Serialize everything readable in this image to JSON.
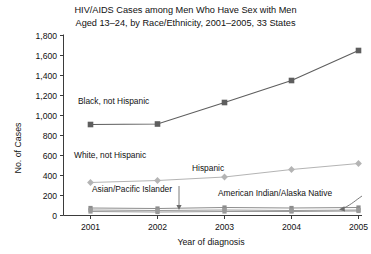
{
  "chart_data": {
    "type": "line",
    "title": "HIV/AIDS Cases among Men Who Have Sex with Men Aged 13–24, by Race/Ethnicity, 2001–2005, 33 States",
    "title_line1": "HIV/AIDS Cases among Men Who Have Sex with Men",
    "title_line2": "Aged 13–24, by Race/Ethnicity, 2001–2005, 33 States",
    "xlabel": "Year of diagnosis",
    "ylabel": "No. of Cases",
    "categories": [
      "2001",
      "2002",
      "2003",
      "2004",
      "2005"
    ],
    "x": [
      2001,
      2002,
      2003,
      2004,
      2005
    ],
    "ylim": [
      0,
      1800
    ],
    "yticks": [
      "0",
      "200",
      "400",
      "600",
      "800",
      "1,000",
      "1,200",
      "1,400",
      "1,600",
      "1,800"
    ],
    "ytick_values": [
      0,
      200,
      400,
      600,
      800,
      1000,
      1200,
      1400,
      1600,
      1800
    ],
    "grid": false,
    "legend": "inline-labels",
    "series": [
      {
        "name": "Black, not Hispanic",
        "marker": "square",
        "color": "#5e5e5e",
        "values": [
          910,
          915,
          1130,
          1350,
          1650
        ]
      },
      {
        "name": "Hispanic",
        "marker": "diamond",
        "color": "#b4b4b4",
        "values": [
          330,
          350,
          385,
          460,
          520
        ]
      },
      {
        "name": "White, not Hispanic",
        "marker": "square",
        "color": "#8c8c8c",
        "values": [
          75,
          70,
          80,
          75,
          80
        ]
      },
      {
        "name": "Asian/Pacific Islander",
        "marker": "square",
        "color": "#9a9a9a",
        "values": [
          55,
          50,
          55,
          50,
          55
        ]
      },
      {
        "name": "American Indian/Alaska Native",
        "marker": "square",
        "color": "#9a9a9a",
        "values": [
          40,
          35,
          40,
          40,
          45
        ]
      }
    ],
    "annotations": [
      {
        "text": "Black, not Hispanic",
        "x": 78,
        "y": 104
      },
      {
        "text": "White, not Hispanic",
        "x": 74,
        "y": 158
      },
      {
        "text": "Hispanic",
        "x": 192,
        "y": 171
      },
      {
        "text": "Asian/Pacific Islander",
        "x": 92,
        "y": 192
      },
      {
        "text": "American Indian/Alaska Native",
        "x": 218,
        "y": 196
      }
    ]
  }
}
